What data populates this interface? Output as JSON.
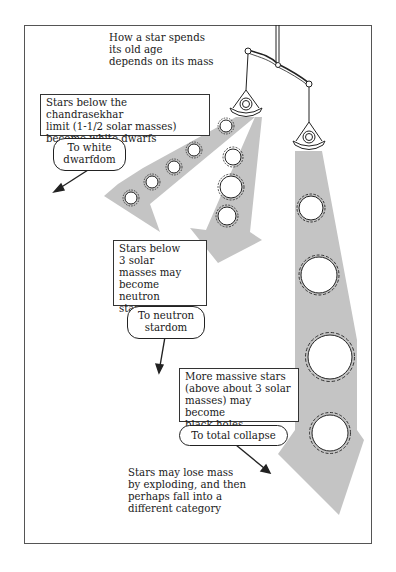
{
  "diagram": {
    "title": "How a star spends\nits old age\ndepends on its mass",
    "branches": [
      {
        "id": "white-dwarf",
        "description": "Stars below the chandrasekhar\nlimit (1-1/2 solar masses)\nbecome white dwarfs",
        "destination": "To white\ndwarfdom"
      },
      {
        "id": "neutron-star",
        "description": "Stars below\n3 solar\nmasses may\nbecome neutron\nstars",
        "destination": "To neutron\nstardom"
      },
      {
        "id": "black-hole",
        "description": "More massive stars\n(above about 3 solar\nmasses) may become\nblack holes",
        "destination": "To total collapse"
      }
    ],
    "footnote": "Stars may lose mass\nby exploding, and then\nperhaps fall into a\ndifferent category",
    "colors": {
      "beam": "#c4c4c4",
      "line": "#222222",
      "frame": "#555555"
    }
  }
}
